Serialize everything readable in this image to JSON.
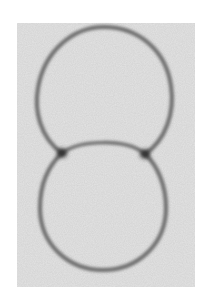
{
  "image": {
    "description": "Grayscale micrograph of two adhered vesicles forming a doublet with a curved shared interface",
    "background_color": "#ffffff",
    "field_color": "#e4e4e4",
    "membrane_color": "#6a6a6a",
    "contact_color": "#2e2e2e",
    "field": {
      "x": 17,
      "y": 23,
      "w": 178,
      "h": 264
    },
    "top_vesicle": {
      "cx": 104,
      "cy": 92,
      "rx": 67,
      "ry": 64
    },
    "bottom_vesicle": {
      "cx": 103,
      "cy": 211,
      "rx": 63,
      "ry": 59
    },
    "interface": {
      "x1": 62,
      "y1": 153,
      "x2": 145,
      "y2": 154,
      "bulge_y": 140
    },
    "contact_points": [
      {
        "x": 62,
        "y": 153
      },
      {
        "x": 145,
        "y": 154
      }
    ]
  }
}
